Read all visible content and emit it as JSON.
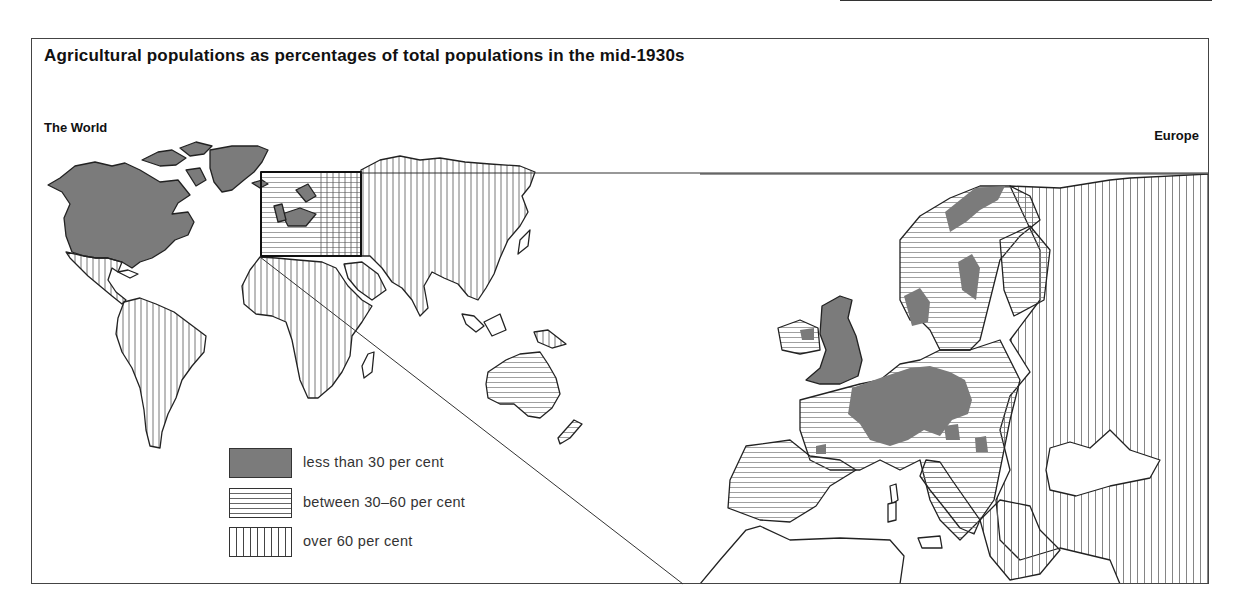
{
  "title": "Agricultural populations as percentages of total populations in the mid-1930s",
  "panels": {
    "world": {
      "label": "The World"
    },
    "europe": {
      "label": "Europe"
    }
  },
  "legend": [
    {
      "key": "low",
      "label": "less than 30 per cent",
      "pattern": "solid-grey"
    },
    {
      "key": "mid",
      "label": "between 30–60 per cent",
      "pattern": "horizontal-lines"
    },
    {
      "key": "high",
      "label": "over 60 per cent",
      "pattern": "vertical-lines"
    }
  ],
  "colors": {
    "low_fill": "#7b7b7b",
    "mid_hatch": "#666666",
    "high_hatch": "#444444",
    "outline": "#222222",
    "background": "#ffffff"
  },
  "regions": {
    "world": [
      {
        "name": "North America (Canada & USA)",
        "category": "low"
      },
      {
        "name": "Greenland",
        "category": "low"
      },
      {
        "name": "Mexico & Central America",
        "category": "high"
      },
      {
        "name": "South America",
        "category": "high"
      },
      {
        "name": "Africa",
        "category": "high"
      },
      {
        "name": "Asia & USSR",
        "category": "high"
      },
      {
        "name": "Australia",
        "category": "mid"
      },
      {
        "name": "New Zealand",
        "category": "mid"
      },
      {
        "name": "Western Europe",
        "category": "mixed"
      }
    ],
    "europe": [
      {
        "name": "Great Britain",
        "category": "low"
      },
      {
        "name": "Ireland",
        "category": "mid"
      },
      {
        "name": "Belgium / Netherlands / Germany",
        "category": "low"
      },
      {
        "name": "Scandinavia",
        "category": "mid"
      },
      {
        "name": "France",
        "category": "mid"
      },
      {
        "name": "Iberia",
        "category": "mid"
      },
      {
        "name": "Italy",
        "category": "mid"
      },
      {
        "name": "Eastern Europe & USSR",
        "category": "high"
      },
      {
        "name": "Balkans",
        "category": "high"
      }
    ]
  }
}
